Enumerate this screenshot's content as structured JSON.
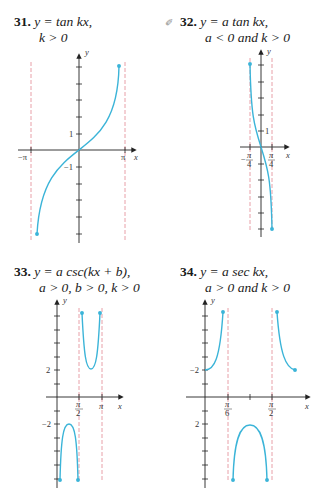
{
  "problems": [
    {
      "number": "31.",
      "line1": "y = tan kx,",
      "line2": "k > 0",
      "graph": {
        "axis_labels": {
          "x": "x",
          "y": "y"
        },
        "tick_labels": {
          "x_neg": "−π",
          "x_pos": "π",
          "y_pos": "1",
          "y_neg": "−1"
        },
        "asymptotes": [
          "−π",
          "π"
        ]
      }
    },
    {
      "number": "32.",
      "icon": "pencil-icon",
      "line1": "y = a tan kx,",
      "line2": "a < 0 and k > 0",
      "graph": {
        "axis_labels": {
          "x": "x",
          "y": "y"
        },
        "tick_labels": {
          "x_neg_num": "π",
          "x_neg_den": "4",
          "x_neg_sign": "−",
          "x_pos_num": "π",
          "x_pos_den": "4",
          "y_pos": "1"
        },
        "asymptotes": [
          "−π/4",
          "π/4"
        ]
      }
    },
    {
      "number": "33.",
      "line1": "y = a csc(kx + b),",
      "line2": "a > 0, b > 0, k > 0",
      "graph": {
        "axis_labels": {
          "x": "x",
          "y": "y"
        },
        "tick_labels": {
          "x1_num": "π",
          "x1_den": "2",
          "x2": "π",
          "y_pos": "2",
          "y_neg": "−2"
        },
        "asymptotes": [
          "π/2",
          "π"
        ]
      }
    },
    {
      "number": "34.",
      "line1": "y = a sec kx,",
      "line2": "a > 0 and k > 0",
      "graph": {
        "axis_labels": {
          "x": "x",
          "y": "y"
        },
        "tick_labels": {
          "x1_num": "π",
          "x1_den": "6",
          "x2_num": "π",
          "x2_den": "2",
          "y_upper": "−2",
          "y_lower": "2"
        },
        "asymptotes": [
          "π/6",
          "π/2"
        ]
      }
    }
  ],
  "colors": {
    "curve": "#3bb4d8",
    "asymptote": "#e8a0a8",
    "axis": "#222222"
  }
}
